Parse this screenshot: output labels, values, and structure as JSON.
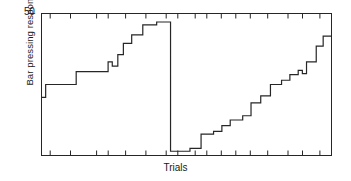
{
  "chart_data": {
    "type": "line",
    "title": "",
    "subtitle": "",
    "xlabel": "Trials",
    "ylabel": "Bar pressing response",
    "ylim": [
      0,
      50
    ],
    "xlim": [
      0,
      100
    ],
    "grid": false,
    "legend": null,
    "y_tick_labels": [
      "50"
    ],
    "y_tick_values": [
      50
    ],
    "x_tick_labels": [],
    "x_tick_values": [
      3,
      10,
      19,
      23,
      29,
      36,
      43,
      47,
      53,
      57,
      62,
      67,
      72,
      78,
      85,
      90,
      96
    ],
    "annotations": [
      "Cumulative record style step function",
      "First acquisition staircase rises to near 50 then drops sharply to baseline",
      "Second re-acquisition staircase rises gradually from baseline"
    ],
    "series": [
      {
        "name": "Bar pressing response",
        "style": "step",
        "color": "#262626",
        "points": [
          [
            0.0,
            20.5
          ],
          [
            1.5,
            20.5
          ],
          [
            1.5,
            25.0
          ],
          [
            12.5,
            25.0
          ],
          [
            12.5,
            29.5
          ],
          [
            24.0,
            29.5
          ],
          [
            24.0,
            33.0
          ],
          [
            25.5,
            33.0
          ],
          [
            25.5,
            31.5
          ],
          [
            27.5,
            31.5
          ],
          [
            27.5,
            35.5
          ],
          [
            29.5,
            35.5
          ],
          [
            29.5,
            39.5
          ],
          [
            32.5,
            39.5
          ],
          [
            32.5,
            42.5
          ],
          [
            36.5,
            42.5
          ],
          [
            36.5,
            46.0
          ],
          [
            41.5,
            46.0
          ],
          [
            41.5,
            47.0
          ],
          [
            46.5,
            47.0
          ],
          [
            46.5,
            1.5
          ],
          [
            53.5,
            1.5
          ],
          [
            53.5,
            2.5
          ],
          [
            57.5,
            2.5
          ],
          [
            57.5,
            7.5
          ],
          [
            62.0,
            7.5
          ],
          [
            62.0,
            8.5
          ],
          [
            65.0,
            8.5
          ],
          [
            65.0,
            10.5
          ],
          [
            68.0,
            10.5
          ],
          [
            68.0,
            12.5
          ],
          [
            72.5,
            12.5
          ],
          [
            72.5,
            14.0
          ],
          [
            75.5,
            14.0
          ],
          [
            75.5,
            18.5
          ],
          [
            79.0,
            18.5
          ],
          [
            79.0,
            21.0
          ],
          [
            82.5,
            21.0
          ],
          [
            82.5,
            25.0
          ],
          [
            86.5,
            25.0
          ],
          [
            86.5,
            26.5
          ],
          [
            89.5,
            26.5
          ],
          [
            89.5,
            28.5
          ],
          [
            92.5,
            28.5
          ],
          [
            92.5,
            30.0
          ],
          [
            94.0,
            30.0
          ],
          [
            94.0,
            28.8
          ],
          [
            95.5,
            28.8
          ],
          [
            95.5,
            33.0
          ],
          [
            99.0,
            33.0
          ],
          [
            99.0,
            38.5
          ],
          [
            101.5,
            38.5
          ],
          [
            101.5,
            42.0
          ],
          [
            104.5,
            42.0
          ]
        ]
      }
    ]
  },
  "axes": {
    "frame_color": "#262626",
    "tick_color": "#262626"
  }
}
